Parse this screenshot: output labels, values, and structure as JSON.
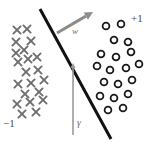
{
  "figure": {
    "background_color": "#ffffff",
    "width": 153,
    "height": 145
  },
  "labels": {
    "positive_class": "+1",
    "negative_class": "−1",
    "weight_vector": "w",
    "margin": "γ"
  },
  "colors": {
    "boundary": "#111111",
    "marker_negative": "#6e6e6e",
    "marker_positive": "#1a1a1a",
    "arrow_w": "#8c8c8c",
    "arrow_gamma": "#9a9a9a",
    "label_text": "#4a4a4a"
  },
  "chart_data": {
    "type": "scatter",
    "title": "",
    "xlabel": "",
    "ylabel": "",
    "grid": false,
    "legend": "none",
    "xlim": [
      0,
      153
    ],
    "ylim": [
      0,
      145
    ],
    "annotations": [
      {
        "name": "positive-class-label",
        "text": "+1",
        "x": 136,
        "y": 21
      },
      {
        "name": "negative-class-label",
        "text": "−1",
        "x": 9,
        "y": 124
      },
      {
        "name": "weight-vector-label",
        "text": "w",
        "x": 75,
        "y": 32
      },
      {
        "name": "margin-label",
        "text": "γ",
        "x": 80,
        "y": 124
      }
    ],
    "decision_boundary": {
      "name": "decision-boundary",
      "type": "line",
      "x1": 40,
      "y1": 9,
      "x2": 111,
      "y2": 139,
      "stroke_width": 3
    },
    "vectors": [
      {
        "name": "weight-vector-arrow",
        "label": "w",
        "x1": 57,
        "y1": 33,
        "x2": 93,
        "y2": 12,
        "stroke_width": 3
      },
      {
        "name": "margin-arrow",
        "label": "γ",
        "x1": 73,
        "y1": 135,
        "x2": 73,
        "y2": 63,
        "stroke_width": 1.6
      }
    ],
    "series": [
      {
        "name": "negative",
        "marker": "x",
        "label": "−1",
        "count": 18,
        "points": [
          [
            17,
            30
          ],
          [
            27,
            29
          ],
          [
            16,
            42
          ],
          [
            31,
            41
          ],
          [
            16,
            53
          ],
          [
            24,
            50
          ],
          [
            18,
            62
          ],
          [
            28,
            59
          ],
          [
            37,
            57
          ],
          [
            26,
            72
          ],
          [
            38,
            70
          ],
          [
            18,
            84
          ],
          [
            31,
            83
          ],
          [
            44,
            80
          ],
          [
            25,
            94
          ],
          [
            39,
            92
          ],
          [
            17,
            104
          ],
          [
            30,
            102
          ],
          [
            43,
            100
          ],
          [
            22,
            114
          ],
          [
            36,
            112
          ]
        ]
      },
      {
        "name": "positive",
        "marker": "o",
        "label": "+1",
        "count": 18,
        "points": [
          [
            106,
            26
          ],
          [
            121,
            24
          ],
          [
            114,
            40
          ],
          [
            128,
            42
          ],
          [
            101,
            54
          ],
          [
            116,
            57
          ],
          [
            131,
            52
          ],
          [
            97,
            66
          ],
          [
            110,
            70
          ],
          [
            126,
            68
          ],
          [
            139,
            64
          ],
          [
            104,
            82
          ],
          [
            118,
            84
          ],
          [
            132,
            80
          ],
          [
            100,
            96
          ],
          [
            114,
            98
          ],
          [
            128,
            94
          ],
          [
            108,
            110
          ],
          [
            123,
            108
          ]
        ]
      }
    ]
  }
}
